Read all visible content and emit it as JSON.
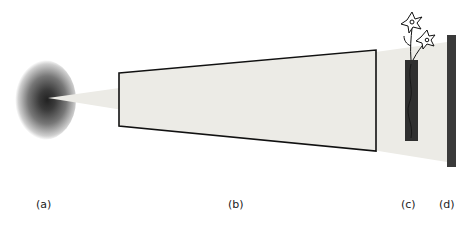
{
  "diagram": {
    "type": "optical-setup-schematic",
    "components": [
      {
        "id": "a",
        "label": "(a)",
        "description": "light source",
        "x": 36
      },
      {
        "id": "b",
        "label": "(b)",
        "description": "light tunnel / projection volume",
        "x": 228
      },
      {
        "id": "c",
        "label": "(c)",
        "description": "vase with flowers (object)",
        "x": 401
      },
      {
        "id": "d",
        "label": "(d)",
        "description": "screen",
        "x": 439
      }
    ],
    "colors": {
      "beam": "#ecebe6",
      "outline": "#111111",
      "object": "#2f2f2f",
      "screen": "#3a3a3a",
      "source_dark": "#1a1a1a"
    }
  }
}
